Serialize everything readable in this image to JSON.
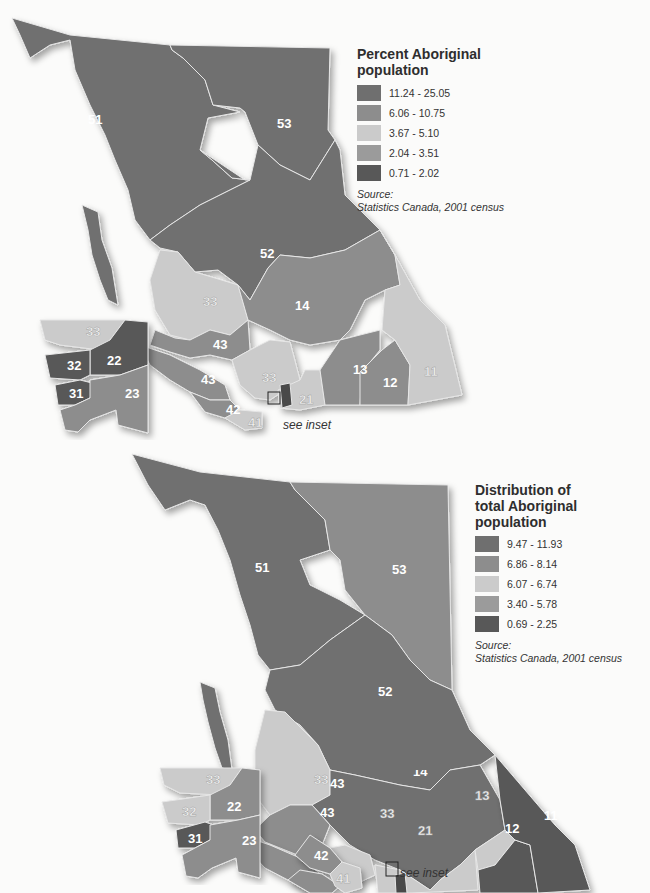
{
  "colors": {
    "class1": "#6f6f6f",
    "class2": "#8d8d8d",
    "class3": "#cbcbcb",
    "class4": "#9b9b9b",
    "class5": "#585858",
    "boundary": "#e6e6e6",
    "background": "#fbfbfa"
  },
  "maps": [
    {
      "legend": {
        "title_line1": "Percent Aboriginal",
        "title_line2": "population",
        "classes": [
          {
            "range": "11.24 - 25.05",
            "color": "#6f6f6f"
          },
          {
            "range": "6.06 - 10.75",
            "color": "#8d8d8d"
          },
          {
            "range": "3.67 - 5.10",
            "color": "#cbcbcb"
          },
          {
            "range": "2.04 - 3.51",
            "color": "#9b9b9b"
          },
          {
            "range": "0.71 - 2.02",
            "color": "#585858"
          }
        ],
        "source_label": "Source:",
        "source_text": "Statistics Canada, 2001 census"
      },
      "inset_note": "see inset",
      "regions": {
        "51": "51",
        "52": "52",
        "53": "53",
        "14": "14",
        "33": "33",
        "43a": "43",
        "43b": "43",
        "42": "42",
        "41": "41",
        "21": "21",
        "13": "13",
        "12": "12",
        "11": "11"
      },
      "inset_regions": {
        "33": "33",
        "32": "32",
        "22": "22",
        "31": "31",
        "23": "23"
      }
    },
    {
      "legend": {
        "title_line1": "Distribution of",
        "title_line2": "total Aboriginal population",
        "classes": [
          {
            "range": "9.47 - 11.93",
            "color": "#6f6f6f"
          },
          {
            "range": "6.86 - 8.14",
            "color": "#8d8d8d"
          },
          {
            "range": "6.07 - 6.74",
            "color": "#cbcbcb"
          },
          {
            "range": "3.40 - 5.78",
            "color": "#9b9b9b"
          },
          {
            "range": "0.69 - 2.25",
            "color": "#585858"
          }
        ],
        "source_label": "Source:",
        "source_text": "Statistics Canada, 2001 census"
      },
      "inset_note": "see inset",
      "regions": {
        "51": "51",
        "52": "52",
        "53": "53",
        "14": "14",
        "33": "33",
        "43a": "43",
        "43b": "43",
        "42": "42",
        "41": "41",
        "21": "21",
        "13": "13",
        "12": "12",
        "11": "11"
      },
      "inset_regions": {
        "33": "33",
        "32": "32",
        "22": "22",
        "31": "31",
        "23": "23"
      }
    }
  ]
}
